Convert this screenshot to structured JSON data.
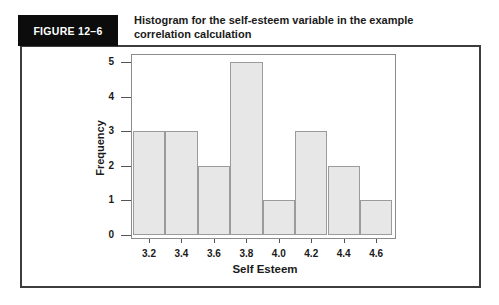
{
  "header": {
    "figure_label": "FIGURE 12–6",
    "title_lines": [
      "Histogram for the self-esteem variable in the example",
      "correlation calculation"
    ]
  },
  "chart_data": {
    "type": "bar",
    "subtype": "histogram",
    "title": "Histogram for the self-esteem variable in the example correlation calculation",
    "categories": [
      "3.2",
      "3.4",
      "3.6",
      "3.8",
      "4.0",
      "4.2",
      "4.4",
      "4.6"
    ],
    "values": [
      3,
      3,
      2,
      5,
      1,
      3,
      2,
      1
    ],
    "xlabel": "Self Esteem",
    "ylabel": "Frequency",
    "ylim": [
      0,
      5
    ],
    "yticks": [
      0,
      1,
      2,
      3,
      4,
      5
    ],
    "grid": false,
    "legend_position": "none",
    "bin_width": 0.2
  },
  "colors": {
    "bar_fill": "#e7e7e7",
    "bar_border": "#9b9b9b",
    "plot_border": "#8c8c8c",
    "figure_border": "#3d3d3d",
    "label_box_bg": "#0c0c0c",
    "label_box_text": "#ffffff",
    "text": "#1a1a1a"
  }
}
